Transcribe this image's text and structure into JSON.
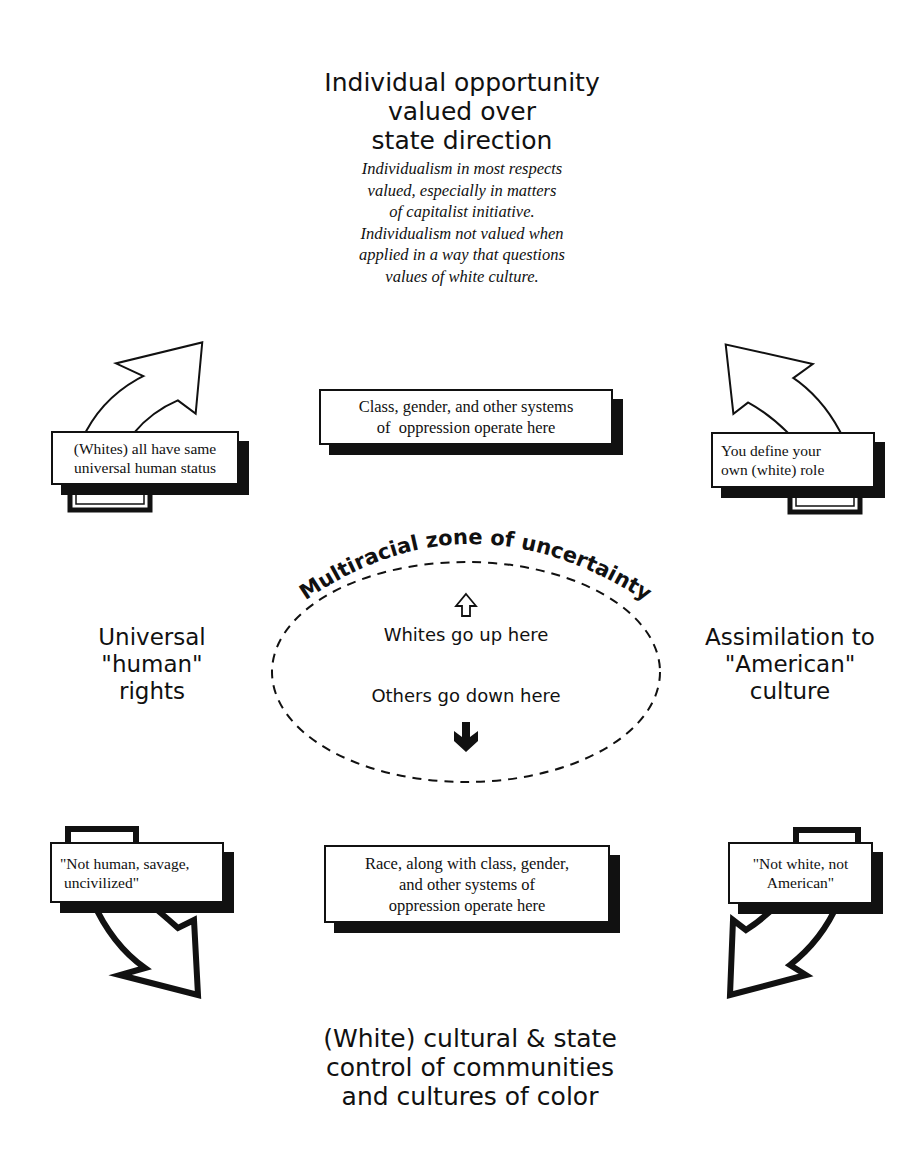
{
  "diagram": {
    "top": {
      "title_lines": [
        "Individual opportunity",
        "valued over",
        "state direction"
      ],
      "description_lines": [
        "Individualism in most respects",
        "valued, especially in matters",
        "of capitalist initiative.",
        "Individualism not valued when",
        "applied in a way that questions",
        "values of white culture."
      ]
    },
    "left": {
      "label_lines": [
        "Universal",
        "\"human\"",
        "rights"
      ]
    },
    "right": {
      "label_lines": [
        "Assimilation to",
        "\"American\"",
        "culture"
      ]
    },
    "bottom": {
      "title_lines": [
        "(White) cultural & state",
        "control of communities",
        "and cultures of color"
      ]
    },
    "boxes": {
      "upper_center": [
        "Class, gender, and other systems",
        "of  oppression operate here"
      ],
      "upper_left": [
        "(Whites) all have same",
        "universal human status"
      ],
      "upper_right": [
        "You define your",
        "own (white) role"
      ],
      "lower_center": [
        "Race, along with class, gender,",
        "and other systems of",
        "oppression operate here"
      ],
      "lower_left": [
        "\"Not human, savage,",
        " uncivilized\""
      ],
      "lower_right": [
        "\"Not white, not",
        "American\""
      ]
    },
    "zone": {
      "title": "Multiracial zone of uncertainty",
      "up_text": "Whites go up here",
      "down_text": "Others go down here",
      "up_icon": "hollow-up-arrow",
      "down_icon": "solid-down-arrow"
    },
    "colors": {
      "ink": "#111111",
      "background": "#ffffff"
    }
  }
}
